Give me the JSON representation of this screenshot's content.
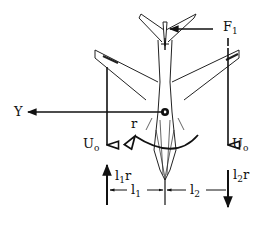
{
  "diagram": {
    "labels": {
      "force_tail": {
        "main": "F",
        "sub": "1"
      },
      "side_force": "Y",
      "velocity_left": {
        "main": "U",
        "sub": "o"
      },
      "velocity_right": {
        "main": "U",
        "sub": "o"
      },
      "yaw_rate": "r",
      "left_induced": {
        "main": "l",
        "sub": "1",
        "suffix": "r"
      },
      "right_induced": {
        "main": "l",
        "sub": "2",
        "suffix": "r"
      },
      "left_arm": {
        "main": "l",
        "sub": "1"
      },
      "right_arm": {
        "main": "l",
        "sub": "2"
      }
    },
    "colors": {
      "ink": "#111111",
      "background": "#ffffff"
    }
  }
}
